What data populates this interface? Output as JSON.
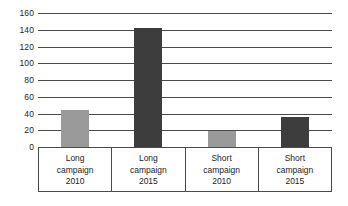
{
  "chart_data": {
    "type": "bar",
    "title": "",
    "subtitle": "",
    "xlabel": "",
    "ylabel": "",
    "categories": [
      "Long campaign 2010",
      "Long campaign 2015",
      "Short campaign 2010",
      "Short campaign 2015"
    ],
    "category_lines": [
      [
        "Long",
        "campaign",
        "2010"
      ],
      [
        "Long",
        "campaign",
        "2015"
      ],
      [
        "Short",
        "campaign",
        "2010"
      ],
      [
        "Short",
        "campaign",
        "2015"
      ]
    ],
    "values": [
      44,
      142,
      19,
      36
    ],
    "bar_colors": [
      "#9a9a9a",
      "#3d3d3d",
      "#9a9a9a",
      "#3d3d3d"
    ],
    "ylim": [
      0,
      160
    ],
    "ytick_labels": [
      "160",
      "140",
      "120",
      "100",
      "80",
      "60",
      "40",
      "20",
      "0"
    ],
    "ytick_values": [
      160,
      140,
      120,
      100,
      80,
      60,
      40,
      20,
      0
    ],
    "grid": true,
    "grid_axis": "y",
    "legend": "none",
    "axis_color": "#4a4a4a",
    "text_color": "#1d1d1d",
    "background": "#ffffff"
  }
}
